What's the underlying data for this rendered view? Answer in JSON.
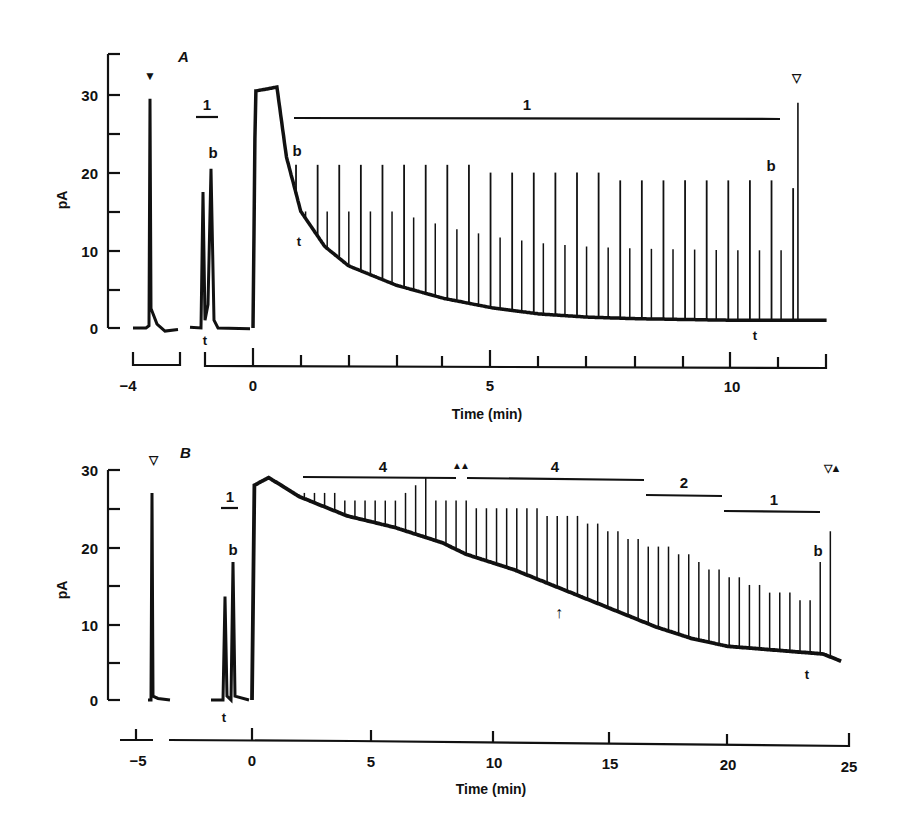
{
  "chart_data": [
    {
      "panel": "A",
      "type": "line",
      "title": "",
      "panel_label": "A",
      "xlabel": "Time (min)",
      "ylabel": "pA",
      "yticks": [
        0,
        10,
        20,
        30
      ],
      "yminor": [
        5,
        15,
        25
      ],
      "ylim": [
        0,
        35
      ],
      "xticks_labeled": [
        -4,
        0,
        5,
        10
      ],
      "xticks_all": [
        0,
        1,
        2,
        3,
        4,
        5,
        6,
        7,
        8,
        9,
        10,
        11
      ],
      "xlim": [
        -1.0,
        12.0
      ],
      "broken_axis_segment": {
        "label": "-4",
        "range": [
          -4.5,
          -3.5
        ]
      },
      "grid": false,
      "series": [
        {
          "name": "current trace",
          "description": "Baseline ~0 pA; single spike to ~29.5 pA at -4 min (filled triangle); two spikes (t ~17.5 pA, b ~20.5 pA) at ~-0.9 min under bar '1'; plateau ~31 pA from 0 to ~0.5 min; decays from ~18 pA to ~1.5 pA by ~6 min with repetitive spikes to ~20 pA; final spike ~29 pA at ~11.3 min (open triangle)",
          "baseline_points": [
            [
              -1.0,
              0.0
            ],
            [
              0.0,
              0.0
            ],
            [
              0.05,
              30.5
            ],
            [
              0.5,
              31.0
            ],
            [
              0.7,
              22.0
            ],
            [
              1.0,
              15.0
            ],
            [
              1.5,
              10.5
            ],
            [
              2.0,
              8.0
            ],
            [
              3.0,
              5.5
            ],
            [
              4.0,
              3.8
            ],
            [
              5.0,
              2.6
            ],
            [
              6.0,
              1.8
            ],
            [
              7.0,
              1.4
            ],
            [
              8.0,
              1.2
            ],
            [
              9.0,
              1.1
            ],
            [
              10.0,
              1.0
            ],
            [
              11.0,
              1.0
            ],
            [
              12.0,
              1.0
            ]
          ],
          "spike_peaks_pA": [
            21,
            21,
            21,
            21,
            21,
            21,
            21,
            21,
            21,
            20,
            20,
            20,
            20,
            20,
            20,
            19,
            19,
            19,
            19,
            19,
            19,
            19,
            19,
            18
          ]
        }
      ],
      "annotations": [
        {
          "text": "▼",
          "meaning": "filled triangle marker",
          "x": -3.9,
          "y": 33
        },
        {
          "text": "1",
          "meaning": "stimulus bar",
          "x_range": [
            -1.25,
            -0.75
          ],
          "y": 27.5
        },
        {
          "text": "b",
          "x": -0.7,
          "y": 22.5
        },
        {
          "text": "t",
          "x": -1.0,
          "y": -1.5
        },
        {
          "text": "1",
          "meaning": "stimulus bar",
          "x_range": [
            0.85,
            11.0
          ],
          "y": 27.3
        },
        {
          "text": "b",
          "x": 0.9,
          "y": 22.5
        },
        {
          "text": "t",
          "x": 0.9,
          "y": 10.5
        },
        {
          "text": "b",
          "x": 10.8,
          "y": 21.5
        },
        {
          "text": "t",
          "x": 10.4,
          "y": -0.8
        },
        {
          "text": "▽",
          "meaning": "open triangle marker",
          "x": 11.4,
          "y": 32
        }
      ]
    },
    {
      "panel": "B",
      "type": "line",
      "title": "",
      "panel_label": "B",
      "xlabel": "Time (min)",
      "ylabel": "pA",
      "yticks": [
        0,
        10,
        20,
        30
      ],
      "yminor": [
        5,
        15,
        25
      ],
      "ylim": [
        0,
        30
      ],
      "xticks_labeled": [
        -5,
        0,
        5,
        10,
        15,
        20,
        25
      ],
      "xlim": [
        -2,
        25
      ],
      "broken_axis_segment": {
        "label": "-5",
        "range": [
          -6,
          -4
        ]
      },
      "grid": false,
      "series": [
        {
          "name": "current trace",
          "description": "Baseline ~0 pA; spike to ~27 pA at -5 min (open triangle); two spikes (t ~13.5 pA, b ~18 pA) at ~-1 min under bar '1'; rapid rise to ~29 pA at 0-0.7 min; slow decline to ~19 pA at ~9 min, ~14 pA at ~14 min, ~7 pA at ~20 min, ~6 pA at 24.5 min with repetitive spikes",
          "baseline_points": [
            [
              -2,
              0.0
            ],
            [
              0.0,
              0.0
            ],
            [
              0.1,
              28.0
            ],
            [
              0.7,
              29.0
            ],
            [
              2.0,
              26.5
            ],
            [
              4.0,
              24.0
            ],
            [
              6.0,
              22.5
            ],
            [
              8.0,
              20.5
            ],
            [
              9.0,
              19.0
            ],
            [
              11.0,
              17.0
            ],
            [
              13.0,
              14.5
            ],
            [
              15.0,
              12.0
            ],
            [
              17.0,
              9.5
            ],
            [
              18.5,
              8.0
            ],
            [
              20.0,
              7.0
            ],
            [
              22.0,
              6.5
            ],
            [
              24.0,
              6.0
            ],
            [
              24.8,
              5.0
            ]
          ],
          "spike_peaks_pA": [
            27,
            27,
            27,
            27,
            26,
            26,
            26,
            26,
            26,
            26,
            27,
            28,
            29,
            26,
            26,
            26,
            26,
            25,
            25,
            25,
            25,
            25,
            25,
            25,
            24,
            24,
            24,
            24,
            23,
            23,
            22,
            22,
            21,
            21,
            20,
            20,
            20,
            19,
            19,
            18,
            17,
            17,
            16,
            16,
            15,
            15,
            14,
            14,
            14,
            13,
            13,
            18,
            22
          ]
        }
      ],
      "annotations": [
        {
          "text": "▽",
          "meaning": "open triangle marker",
          "x": -5,
          "y": 32
        },
        {
          "text": "1",
          "meaning": "stimulus bar",
          "x_range": [
            -1.3,
            -0.6
          ],
          "y": 24.5
        },
        {
          "text": "b",
          "x": -0.8,
          "y": 19.5
        },
        {
          "text": "t",
          "x": -1.2,
          "y": -1.5
        },
        {
          "text": "4",
          "meaning": "stimulus bar",
          "x_range": [
            2.1,
            8.6
          ],
          "y": 29.4
        },
        {
          "text": "▲▲",
          "meaning": "paired filled triangles",
          "x": 8.8,
          "y": 31
        },
        {
          "text": "4",
          "meaning": "stimulus bar",
          "x_range": [
            9.0,
            16.5
          ],
          "y": 29.2
        },
        {
          "text": "2",
          "meaning": "stimulus bar",
          "x_range": [
            16.7,
            19.9
          ],
          "y": 26.5
        },
        {
          "text": "1",
          "meaning": "stimulus bar",
          "x_range": [
            20.0,
            23.9
          ],
          "y": 24.5
        },
        {
          "text": "↑",
          "meaning": "arrow",
          "x": 12.9,
          "y": 11.5
        },
        {
          "text": "b",
          "x": 23.4,
          "y": 17.8
        },
        {
          "text": "t",
          "x": 23.2,
          "y": 3.8
        },
        {
          "text": "▽▲",
          "meaning": "open and filled triangle markers",
          "x": 24.3,
          "y": 30.5
        }
      ]
    }
  ],
  "panels": {
    "A": {
      "label": "A",
      "ylabel": "pA",
      "xlabel": "Time (min)",
      "ytick_labels": [
        "0",
        "10",
        "20",
        "30"
      ],
      "xtick_labels": [
        "−4",
        "0",
        "5",
        "10"
      ],
      "bars": [
        "1",
        "1"
      ],
      "markers": {
        "filled_down": "▼",
        "open_down": "▽"
      },
      "letters": {
        "b": "b",
        "t": "t"
      }
    },
    "B": {
      "label": "B",
      "ylabel": "pA",
      "xlabel": "Time (min)",
      "ytick_labels": [
        "0",
        "10",
        "20",
        "30"
      ],
      "xtick_labels": [
        "−5",
        "0",
        "5",
        "10",
        "15",
        "20",
        "25"
      ],
      "bars": [
        "1",
        "4",
        "4",
        "2",
        "1"
      ],
      "markers": {
        "open_down": "▽",
        "paired_up": "▲▲",
        "open_filled": "▽▲",
        "arrow_up": "↑"
      },
      "letters": {
        "b": "b",
        "t": "t"
      }
    }
  },
  "style": {
    "ink": "#111111",
    "paper": "#ffffff"
  }
}
